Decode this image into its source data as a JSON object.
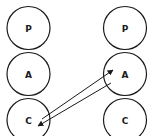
{
  "diagram": {
    "type": "transactional-analysis-ego-states",
    "colors": {
      "stroke": "#1a1a1a",
      "fill": "#ffffff"
    },
    "left_person": {
      "states": [
        {
          "label": "P",
          "cx": 28.5,
          "cy": 28
        },
        {
          "label": "A",
          "cx": 28.5,
          "cy": 74
        },
        {
          "label": "C",
          "cx": 28.5,
          "cy": 120
        }
      ]
    },
    "right_person": {
      "states": [
        {
          "label": "P",
          "cx": 125,
          "cy": 28
        },
        {
          "label": "A",
          "cx": 125,
          "cy": 74
        },
        {
          "label": "C",
          "cx": 125,
          "cy": 120
        }
      ]
    },
    "transactions": [
      {
        "from": "left.C",
        "to": "right.A",
        "direction": "arrow at right A"
      },
      {
        "from": "right.A",
        "to": "left.C",
        "direction": "arrow at left C"
      }
    ]
  }
}
